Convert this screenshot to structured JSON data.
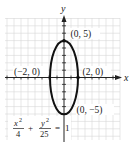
{
  "figure": {
    "type": "ellipse-graph",
    "equation": {
      "term1_num": "x",
      "term1_exp": "2",
      "term1_den": "4",
      "plus": "+",
      "term2_num": "y",
      "term2_exp": "2",
      "term2_den": "25",
      "equals": "=",
      "rhs": "1"
    },
    "axes": {
      "x_label": "x",
      "y_label": "y"
    },
    "points": [
      {
        "label": "(0, 5)",
        "x": 0,
        "y": 5
      },
      {
        "label": "(2, 0)",
        "x": 2,
        "y": 0
      },
      {
        "label": "(−2, 0)",
        "x": -2,
        "y": 0
      },
      {
        "label": "(0, −5)",
        "x": 0,
        "y": -5
      }
    ],
    "ellipse": {
      "a": 2,
      "b": 5,
      "center": [
        0,
        0
      ]
    },
    "colors": {
      "curve": "#111111",
      "grid": "#d4d4d4",
      "axis": "#222222"
    }
  }
}
